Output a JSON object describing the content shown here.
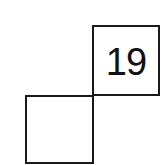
{
  "diagram": {
    "cells": [
      {
        "position": "top-right",
        "value": "19"
      },
      {
        "position": "bottom-left",
        "value": ""
      }
    ],
    "colors": {
      "border": "#1a1a1a",
      "background": "#ffffff",
      "text": "#111111"
    }
  }
}
